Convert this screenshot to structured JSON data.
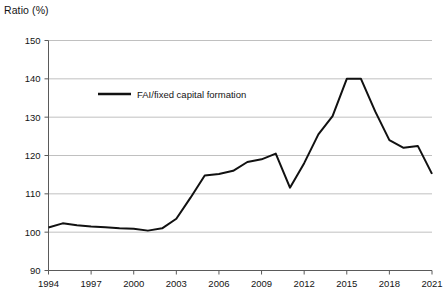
{
  "chart_data": {
    "type": "line",
    "title": "Ratio (%)",
    "xlabel": "",
    "ylabel": "Ratio (%)",
    "ylim": [
      90,
      150
    ],
    "xlim": [
      1994,
      2021
    ],
    "ytick_step": 10,
    "xtick_step": 3,
    "grid": true,
    "legend_position": "upper-left-inside",
    "yticks": [
      90,
      100,
      110,
      120,
      130,
      140,
      150
    ],
    "xticks": [
      1994,
      1997,
      2000,
      2003,
      2006,
      2009,
      2012,
      2015,
      2018,
      2021
    ],
    "series": [
      {
        "name": "FAI/fixed capital formation",
        "color": "#111111",
        "x": [
          1994,
          1995,
          1996,
          1997,
          1998,
          1999,
          2000,
          2001,
          2002,
          2003,
          2004,
          2005,
          2006,
          2007,
          2008,
          2009,
          2010,
          2011,
          2012,
          2013,
          2014,
          2015,
          2016,
          2017,
          2018,
          2019,
          2020,
          2021
        ],
        "values": [
          101.2,
          102.3,
          101.8,
          101.5,
          101.3,
          101.0,
          100.9,
          100.4,
          101.0,
          103.5,
          109.0,
          114.8,
          115.2,
          116.0,
          118.3,
          119.0,
          120.5,
          111.6,
          118.0,
          125.5,
          130.3,
          140.0,
          140.0,
          131.5,
          124.0,
          122.0,
          122.5,
          115.2
        ]
      }
    ],
    "legend_entries": [
      "FAI/fixed capital formation"
    ]
  },
  "axes": {
    "y_axis_title": "Ratio (%)"
  }
}
